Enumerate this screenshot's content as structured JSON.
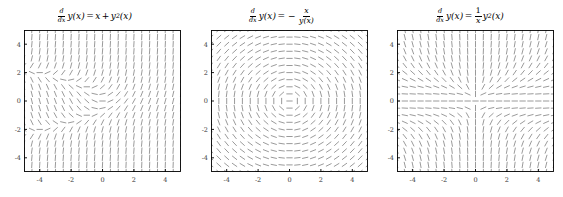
{
  "figure": {
    "width": 563,
    "height": 197,
    "background": "#ffffff",
    "panel_count": 3
  },
  "style": {
    "axis_color": "#000000",
    "field_color": "#808080",
    "tick_label_color": "#3a3a3a",
    "title_color": "#000000"
  },
  "panels": [
    {
      "id": "slope-field-1",
      "title_text": "d/dx y(x) = x + y^2(x)",
      "title_parts": {
        "frac_num": "d",
        "frac_den": "dx",
        "lhs": "y(x)",
        "equals": "=",
        "rhs_1": "x",
        "plus": "+",
        "rhs_2_base": "y",
        "rhs_2_exp": "2",
        "rhs_2_arg": "(x)"
      },
      "x_ticks": [
        "-4",
        "-2",
        "0",
        "2",
        "4"
      ],
      "y_ticks": [
        "4",
        "2",
        "0",
        "-2",
        "-4"
      ],
      "x_tick_values": [
        -4,
        -2,
        0,
        2,
        4
      ],
      "y_tick_values": [
        4,
        2,
        0,
        -2,
        -4
      ]
    },
    {
      "id": "slope-field-2",
      "title_text": "d/dx y(x) = -x/y(x)",
      "title_parts": {
        "frac_num": "d",
        "frac_den": "dx",
        "lhs": "y(x)",
        "equals": "=",
        "minus": "−",
        "rhs_num": "x",
        "rhs_den": "y(x)"
      },
      "x_ticks": [
        "-4",
        "-2",
        "0",
        "2",
        "4"
      ],
      "y_ticks": [
        "4",
        "2",
        "0",
        "-2",
        "-4"
      ],
      "x_tick_values": [
        -4,
        -2,
        0,
        2,
        4
      ],
      "y_tick_values": [
        4,
        2,
        0,
        -2,
        -4
      ]
    },
    {
      "id": "slope-field-3",
      "title_text": "d/dx y(x) = (1/x) y^2(x)",
      "title_parts": {
        "frac_num": "d",
        "frac_den": "dx",
        "lhs": "y(x)",
        "equals": "=",
        "rhs_num": "1",
        "rhs_den": "x",
        "rhs_2_base": "y",
        "rhs_2_exp": "2",
        "rhs_2_arg": "(x)"
      },
      "x_ticks": [
        "-4",
        "-2",
        "0",
        "2",
        "4"
      ],
      "y_ticks": [
        "4",
        "2",
        "0",
        "-2",
        "-4"
      ],
      "x_tick_values": [
        -4,
        -2,
        0,
        2,
        4
      ],
      "y_tick_values": [
        4,
        2,
        0,
        -2,
        -4
      ]
    }
  ],
  "chart_data": [
    {
      "type": "scatter",
      "plot_kind": "slope-field",
      "title": "d/dx y(x) = x + y^2(x)",
      "equation": "dy/dx = x + y^2",
      "xlabel": "",
      "ylabel": "",
      "xlim": [
        -5,
        5
      ],
      "ylim": [
        -5,
        5
      ],
      "xticks": [
        -4,
        -2,
        0,
        2,
        4
      ],
      "yticks": [
        -4,
        -2,
        0,
        2,
        4
      ],
      "grid": false,
      "legend": "none",
      "grid_points": 21,
      "slope_formula": "x + y*y",
      "dash_color": "#808080"
    },
    {
      "type": "scatter",
      "plot_kind": "slope-field",
      "title": "d/dx y(x) = -x/y(x)",
      "equation": "dy/dx = -x/y",
      "xlabel": "",
      "ylabel": "",
      "xlim": [
        -5,
        5
      ],
      "ylim": [
        -5,
        5
      ],
      "xticks": [
        -4,
        -2,
        0,
        2,
        4
      ],
      "yticks": [
        -4,
        -2,
        0,
        2,
        4
      ],
      "grid": false,
      "legend": "none",
      "grid_points": 21,
      "slope_formula": "-x/y",
      "dash_color": "#808080"
    },
    {
      "type": "scatter",
      "plot_kind": "slope-field",
      "title": "d/dx y(x) = (1/x) y^2(x)",
      "equation": "dy/dx = y^2/x",
      "xlabel": "",
      "ylabel": "",
      "xlim": [
        -5,
        5
      ],
      "ylim": [
        -5,
        5
      ],
      "xticks": [
        -4,
        -2,
        0,
        2,
        4
      ],
      "yticks": [
        -4,
        -2,
        0,
        2,
        4
      ],
      "grid": false,
      "legend": "none",
      "grid_points": 21,
      "slope_formula": "y*y/x",
      "dash_color": "#808080"
    }
  ]
}
